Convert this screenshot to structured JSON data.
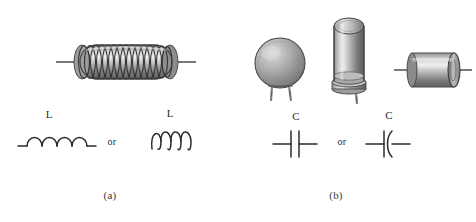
{
  "figure": {
    "background_color": "#ffffff",
    "width": 476,
    "height": 222,
    "ink_color": "#333333",
    "metal_light": "#d8d8d8",
    "metal_mid": "#9a9a9a",
    "metal_dark": "#5a5a5a"
  },
  "panel_a": {
    "caption": "(a)",
    "component_name": "inductor-coil-photo",
    "symbols": [
      {
        "label": "L",
        "style": "humped-inductor-symbol"
      },
      {
        "label": "L",
        "style": "looped-coil-inductor-symbol"
      }
    ],
    "conjunction": "or"
  },
  "panel_b": {
    "caption": "(b)",
    "components": [
      {
        "name": "disc-ceramic-capacitor-photo"
      },
      {
        "name": "electrolytic-capacitor-photo"
      },
      {
        "name": "axial-capacitor-photo"
      }
    ],
    "symbols": [
      {
        "label": "C",
        "style": "parallel-plate-capacitor-symbol"
      },
      {
        "label": "C",
        "style": "curved-plate-capacitor-symbol"
      }
    ],
    "conjunction": "or"
  }
}
